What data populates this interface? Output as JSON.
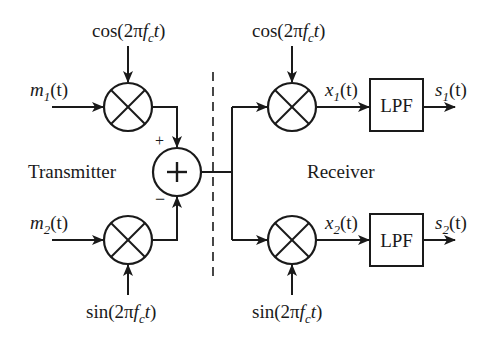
{
  "diagram": {
    "sections": {
      "transmitter": "Transmitter",
      "receiver": "Receiver"
    },
    "transmitter": {
      "inputs": [
        {
          "symbol": "m",
          "subscript": "1",
          "arg": "(t)"
        },
        {
          "symbol": "m",
          "subscript": "2",
          "arg": "(t)"
        }
      ],
      "carriers": [
        {
          "func": "cos(2π",
          "f": "f",
          "fsub": "c",
          "t": "t",
          "close": ")"
        },
        {
          "func": "sin(2π",
          "f": "f",
          "fsub": "c",
          "t": "t",
          "close": ")"
        }
      ],
      "adder": {
        "symbol": "+",
        "plus_sign": "+",
        "minus_sign": "−"
      }
    },
    "receiver": {
      "carriers": [
        {
          "func": "cos(2π",
          "f": "f",
          "fsub": "c",
          "t": "t",
          "close": ")"
        },
        {
          "func": "sin(2π",
          "f": "f",
          "fsub": "c",
          "t": "t",
          "close": ")"
        }
      ],
      "intermediate": [
        {
          "symbol": "x",
          "subscript": "1",
          "arg": "(t)"
        },
        {
          "symbol": "x",
          "subscript": "2",
          "arg": "(t)"
        }
      ],
      "filters": [
        {
          "label": "LPF"
        },
        {
          "label": "LPF"
        }
      ],
      "outputs": [
        {
          "symbol": "s",
          "subscript": "1",
          "arg": "(t)"
        },
        {
          "symbol": "s",
          "subscript": "2",
          "arg": "(t)"
        }
      ]
    },
    "colors": {
      "stroke": "#1a1a1a",
      "background": "#ffffff"
    }
  }
}
